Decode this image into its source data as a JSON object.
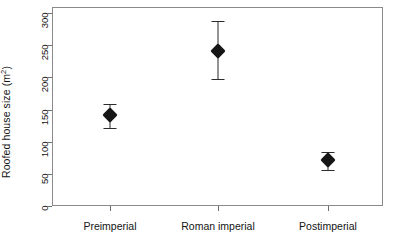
{
  "chart_data": {
    "type": "scatter",
    "title": "",
    "xlabel": "",
    "ylabel": "Roofed house size (m2)",
    "ylabel_base": "Roofed house size (m",
    "ylabel_sup": "2",
    "ylabel_close": ")",
    "categories": [
      "Preimperial",
      "Roman imperial",
      "Postimperial"
    ],
    "values": [
      141,
      241,
      71
    ],
    "error_low": [
      121,
      198,
      56
    ],
    "error_high": [
      158,
      288,
      84
    ],
    "ylim": [
      0,
      310
    ],
    "yticks": [
      0,
      50,
      100,
      150,
      200,
      250,
      300
    ],
    "ytick_labels": [
      "0",
      "50",
      "100",
      "150",
      "200",
      "250",
      "300"
    ],
    "grid": false,
    "legend": false,
    "marker": "diamond",
    "marker_color": "#161616",
    "error_bar_color": "#2b2b2b",
    "axis_color": "#8a8a8a",
    "background": "#ffffff"
  }
}
